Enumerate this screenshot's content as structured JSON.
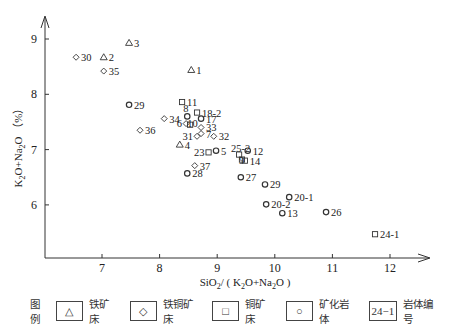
{
  "chart_data": {
    "type": "scatter",
    "title": "",
    "xlabel": "SiO2/ (K2O+Na2O)",
    "ylabel": "K2O+Na2O (%)",
    "xlim": [
      6.0,
      12.8
    ],
    "ylim": [
      5.05,
      9.3
    ],
    "xticks": [
      7,
      8,
      9,
      10,
      11,
      12
    ],
    "yticks": [
      6,
      7,
      8,
      9
    ],
    "grid": false,
    "legend_position": "bottom",
    "series": [
      {
        "name": "铁矿床",
        "marker": "triangle",
        "points": [
          {
            "label": "1",
            "x": 8.55,
            "y": 8.44
          },
          {
            "label": "2",
            "x": 7.03,
            "y": 8.67
          },
          {
            "label": "3",
            "x": 7.47,
            "y": 8.93
          },
          {
            "label": "4",
            "x": 8.35,
            "y": 7.09
          }
        ]
      },
      {
        "name": "铁铜矿床",
        "marker": "diamond",
        "points": [
          {
            "label": "30",
            "x": 6.55,
            "y": 8.67
          },
          {
            "label": "35",
            "x": 7.03,
            "y": 8.42
          },
          {
            "label": "34",
            "x": 8.08,
            "y": 7.56
          },
          {
            "label": "36",
            "x": 7.66,
            "y": 7.35
          },
          {
            "label": "6",
            "x": 8.46,
            "y": 7.47
          },
          {
            "label": "33",
            "x": 8.72,
            "y": 7.4
          },
          {
            "label": "31",
            "x": 8.65,
            "y": 7.24
          },
          {
            "label": "7",
            "x": 8.72,
            "y": 7.29
          },
          {
            "label": "32",
            "x": 8.94,
            "y": 7.24
          },
          {
            "label": "37",
            "x": 8.61,
            "y": 6.71
          }
        ]
      },
      {
        "name": "铜矿床",
        "marker": "square",
        "points": [
          {
            "label": "11",
            "x": 8.39,
            "y": 7.86
          },
          {
            "label": "18-2",
            "x": 8.65,
            "y": 7.67
          },
          {
            "label": "10",
            "x": 8.53,
            "y": 7.45
          },
          {
            "label": "23",
            "x": 8.85,
            "y": 6.95
          },
          {
            "label": "25-2",
            "x": 9.38,
            "y": 6.91
          },
          {
            "label": "9",
            "x": 9.43,
            "y": 6.82
          },
          {
            "label": "14",
            "x": 9.48,
            "y": 6.8
          },
          {
            "label": "24-1",
            "x": 11.74,
            "y": 5.47
          }
        ]
      },
      {
        "name": "矿化岩体",
        "marker": "circle",
        "points": [
          {
            "label": "29",
            "x": 7.47,
            "y": 7.81
          },
          {
            "label": "8",
            "x": 8.48,
            "y": 7.6
          },
          {
            "label": "17",
            "x": 8.72,
            "y": 7.56
          },
          {
            "label": "5",
            "x": 8.98,
            "y": 6.98
          },
          {
            "label": "12",
            "x": 9.53,
            "y": 6.98
          },
          {
            "label": "28",
            "x": 8.48,
            "y": 6.57
          },
          {
            "label": "27",
            "x": 9.41,
            "y": 6.5
          },
          {
            "label": "29",
            "x": 9.83,
            "y": 6.37
          },
          {
            "label": "20-1",
            "x": 10.25,
            "y": 6.14
          },
          {
            "label": "20-2",
            "x": 9.85,
            "y": 6.01
          },
          {
            "label": "13",
            "x": 10.13,
            "y": 5.85
          },
          {
            "label": "26",
            "x": 10.89,
            "y": 5.87
          }
        ]
      }
    ]
  },
  "legend": {
    "title": "图例",
    "items": [
      {
        "symbol": "△",
        "label": "铁矿床"
      },
      {
        "symbol": "◇",
        "label": "铁铜矿床"
      },
      {
        "symbol": "□",
        "label": "铜矿床"
      },
      {
        "symbol": "○",
        "label": "矿化岩体"
      },
      {
        "symbol": "24−1",
        "label": "岩体编号"
      }
    ]
  }
}
